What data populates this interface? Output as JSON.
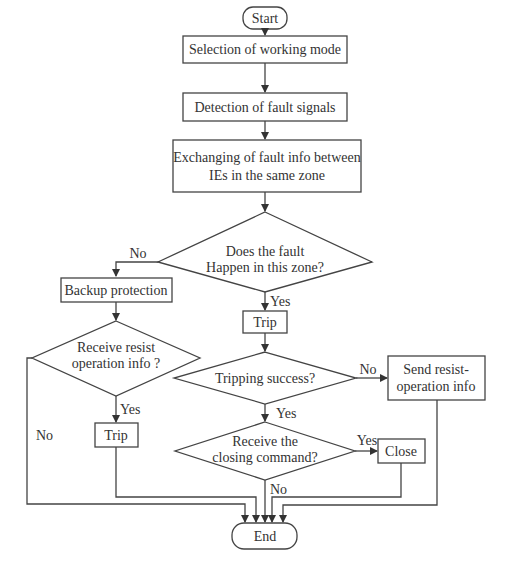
{
  "flowchart": {
    "start": "Start",
    "end": "End",
    "steps": {
      "selection": "Selection of working mode",
      "detection": "Detection of fault signals",
      "exchange_line1": "Exchanging of fault info between",
      "exchange_line2": "IEs in the same zone",
      "backup": "Backup protection",
      "trip_main": "Trip",
      "trip_backup": "Trip",
      "send_line1": "Send resist-",
      "send_line2": "operation info",
      "close": "Close"
    },
    "decisions": {
      "fault_zone_line1": "Does the fault",
      "fault_zone_line2": "Happen in this zone?",
      "resist_line1": "Receive resist",
      "resist_line2": "operation info ?",
      "trip_success": "Tripping success?",
      "closing_line1": "Receive the",
      "closing_line2": "closing command?"
    },
    "edge_labels": {
      "zone_no": "No",
      "zone_yes": "Yes",
      "resist_yes": "Yes",
      "resist_no": "No",
      "success_no": "No",
      "success_yes": "Yes",
      "closing_yes": "Yes",
      "closing_no": "No"
    }
  }
}
